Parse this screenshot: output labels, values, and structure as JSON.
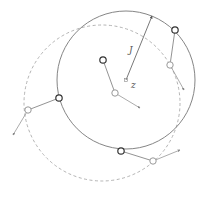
{
  "diagram": {
    "labels": {
      "displacement": "J",
      "center": "z"
    },
    "colors": {
      "solid_circle": "#777777",
      "dashed_circle": "#aaaaaa",
      "dark_point": "#333333",
      "light_point": "#999999",
      "vector": "#888888",
      "arrow": "#555555"
    },
    "solid_circle": {
      "cx": 126,
      "cy": 80,
      "r": 69
    },
    "dashed_circle": {
      "cx": 102,
      "cy": 103,
      "r": 78
    },
    "center_point": {
      "x": 126,
      "y": 80
    },
    "displacement_arrow": {
      "x1": 126,
      "y1": 80,
      "x2": 152,
      "y2": 16
    },
    "point_pairs": [
      {
        "dark": [
          103,
          60
        ],
        "light": [
          115,
          93
        ],
        "tip": [
          140,
          108
        ]
      },
      {
        "dark": [
          175,
          30
        ],
        "light": [
          170,
          65
        ],
        "tip": [
          184,
          90
        ]
      },
      {
        "dark": [
          59,
          98
        ],
        "light": [
          28,
          110
        ],
        "tip": [
          13,
          135
        ]
      },
      {
        "dark": [
          121,
          151
        ],
        "light": [
          153,
          161
        ],
        "tip": [
          180,
          150
        ]
      }
    ]
  }
}
